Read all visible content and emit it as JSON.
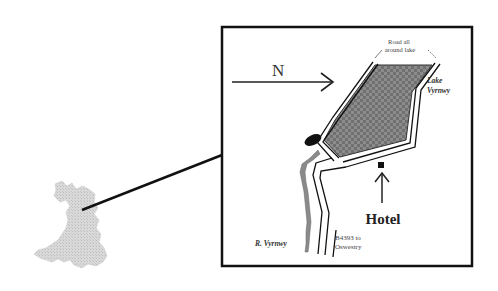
{
  "map": {
    "inset_region": "Wales",
    "north_label": "N",
    "road_label": "Road all around lake",
    "road_label_line1": "Road all",
    "road_label_line2": "around lake",
    "lake_label_line1": "Lake",
    "lake_label_line2": "Vyrnwy",
    "river_label": "R. Vyrnwy",
    "road_number_line1": "B4393 to",
    "road_number_line2": "Oswestry",
    "hotel_label": "Hotel",
    "colors": {
      "frame": "#111111",
      "lake_fill": "#6e6e6e",
      "lake_grid": "#9a9a9a",
      "wales_fill": "#d4d4d4",
      "river_fill": "#8a8a8a",
      "text": "#222222"
    }
  }
}
